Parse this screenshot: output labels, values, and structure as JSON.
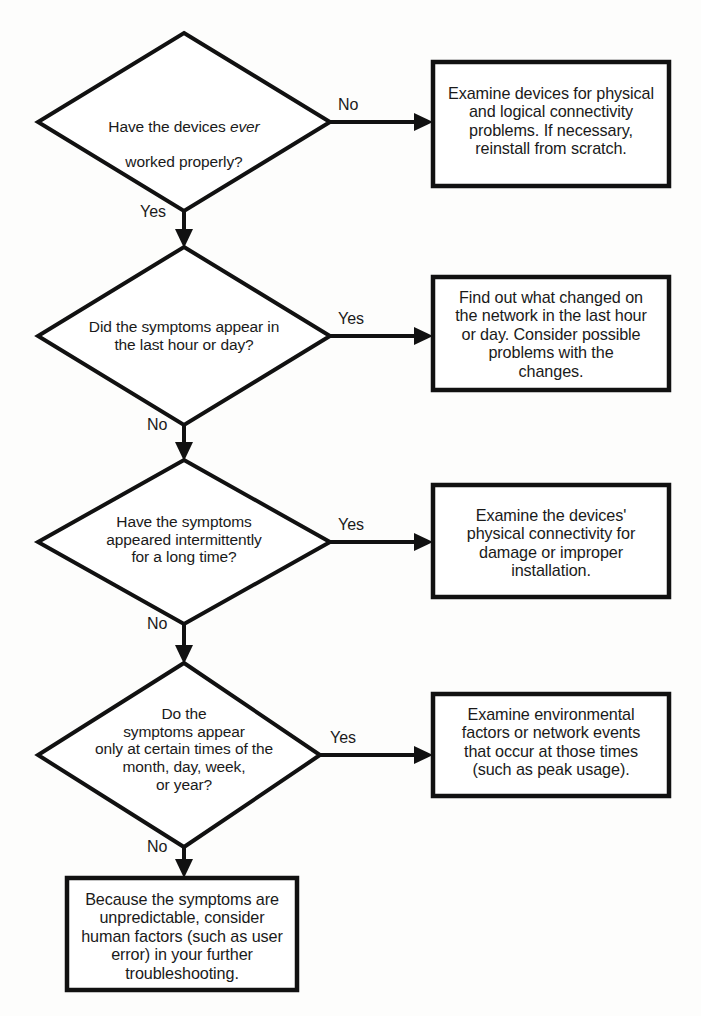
{
  "diagram": {
    "stroke_color": "#111111",
    "fill_color": "#ffffff",
    "background_color": "#fdfdfc"
  },
  "nodes": {
    "decision1": {
      "shape": "diamond",
      "text_line1_a": "Have the devices ",
      "text_line1_italic": "ever",
      "text_line2": "worked properly?"
    },
    "decision2": {
      "shape": "diamond",
      "text": "Did the symptoms appear in\nthe last hour or day?"
    },
    "decision3": {
      "shape": "diamond",
      "text": "Have the symptoms\nappeared intermittently\nfor a long time?"
    },
    "decision4": {
      "shape": "diamond",
      "text": "Do the\nsymptoms appear\nonly at certain times of the\nmonth, day, week,\nor year?"
    },
    "action1": {
      "shape": "rectangle",
      "text": "Examine devices for physical\nand logical connectivity\nproblems.  If necessary,\nreinstall from scratch."
    },
    "action2": {
      "shape": "rectangle",
      "text": "Find out what changed on\nthe network in the last hour\nor day.  Consider possible\nproblems with the\nchanges."
    },
    "action3": {
      "shape": "rectangle",
      "text": "Examine the devices'\nphysical connectivity for\ndamage or improper\ninstallation."
    },
    "action4": {
      "shape": "rectangle",
      "text": "Examine environmental\nfactors or network events\nthat occur at those times\n(such as peak usage)."
    },
    "action5": {
      "shape": "rectangle",
      "text": "Because the symptoms are\nunpredictable, consider\nhuman factors (such as user\nerror) in your further\ntroubleshooting."
    }
  },
  "edges": {
    "d1_right_label": "No",
    "d1_down_label": "Yes",
    "d2_right_label": "Yes",
    "d2_down_label": "No",
    "d3_right_label": "Yes",
    "d3_down_label": "No",
    "d4_right_label": "Yes",
    "d4_down_label": "No"
  }
}
